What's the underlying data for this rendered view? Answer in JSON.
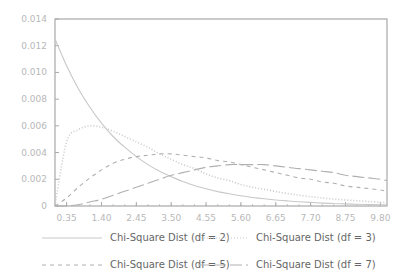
{
  "chart_data": {
    "type": "line",
    "title": "",
    "xlabel": "",
    "ylabel": "",
    "xlim": [
      0,
      10
    ],
    "ylim": [
      0,
      0.014
    ],
    "grid": false,
    "legend_position": "bottom",
    "x_ticks": [
      "0.35",
      "1.40",
      "2.45",
      "3.50",
      "4.55",
      "5.60",
      "6.65",
      "7.70",
      "8.75",
      "9.80"
    ],
    "y_ticks": [
      "0",
      "0.002",
      "0.004",
      "0.006",
      "0.008",
      "0.010",
      "0.012",
      "0.014"
    ],
    "x": [
      0.0,
      0.35,
      0.7,
      1.05,
      1.4,
      1.75,
      2.1,
      2.45,
      2.8,
      3.15,
      3.5,
      3.85,
      4.2,
      4.55,
      4.9,
      5.25,
      5.6,
      5.95,
      6.3,
      6.65,
      7.0,
      7.35,
      7.7,
      8.05,
      8.4,
      8.75,
      9.1,
      9.45,
      9.8,
      10.0
    ],
    "series": [
      {
        "name": "Chi-Square Dist (df = 2)",
        "style": "solid",
        "color": "#c8c8c8",
        "values": [
          0.0125,
          0.0105,
          0.0088,
          0.0074,
          0.0062,
          0.0052,
          0.0044,
          0.0037,
          0.0031,
          0.0026,
          0.0022,
          0.00183,
          0.00153,
          0.00129,
          0.00108,
          0.00091,
          0.00076,
          0.00064,
          0.00054,
          0.00045,
          0.00038,
          0.00032,
          0.00027,
          0.00022,
          0.00019,
          0.00016,
          0.00013,
          0.00011,
          9e-05,
          8e-05
        ]
      },
      {
        "name": "Chi-Square Dist (df = 3)",
        "style": "dotted",
        "color": "#c8c8c8",
        "values": [
          0.0,
          0.0048,
          0.0057,
          0.006,
          0.0059,
          0.0056,
          0.0052,
          0.0048,
          0.0044,
          0.0039,
          0.0035,
          0.0031,
          0.0028,
          0.0024,
          0.0021,
          0.0019,
          0.0016,
          0.0014,
          0.00125,
          0.00108,
          0.00094,
          0.00081,
          0.0007,
          0.0006,
          0.00052,
          0.00045,
          0.00039,
          0.00033,
          0.00028,
          0.00026
        ]
      },
      {
        "name": "Chi-Square Dist (df = 5)",
        "style": "dashed",
        "color": "#b0b0b0",
        "values": [
          0.0,
          0.0006,
          0.0014,
          0.0021,
          0.0027,
          0.0032,
          0.0035,
          0.0037,
          0.0038,
          0.0039,
          0.0039,
          0.0038,
          0.0037,
          0.0036,
          0.0034,
          0.0033,
          0.0031,
          0.0029,
          0.0027,
          0.0025,
          0.0023,
          0.0021,
          0.002,
          0.0018,
          0.0017,
          0.0015,
          0.0014,
          0.0013,
          0.0012,
          0.0011
        ]
      },
      {
        "name": "Chi-Square Dist (df = 7)",
        "style": "long-dashed",
        "color": "#b0b0b0",
        "values": [
          0.0,
          0.0,
          0.0001,
          0.0003,
          0.0005,
          0.0008,
          0.0011,
          0.0014,
          0.0017,
          0.002,
          0.0023,
          0.0025,
          0.0027,
          0.0029,
          0.003,
          0.0031,
          0.0031,
          0.0031,
          0.0031,
          0.003,
          0.0029,
          0.0028,
          0.0027,
          0.0026,
          0.0025,
          0.0023,
          0.0022,
          0.0021,
          0.002,
          0.0019
        ]
      }
    ]
  },
  "legend": {
    "items": [
      {
        "label": "Chi-Square Dist (df = 2)"
      },
      {
        "label": "Chi-Square Dist (df = 3)"
      },
      {
        "label": "Chi-Square Dist (df = 5)"
      },
      {
        "label": "Chi-Square Dist (df = 7)"
      }
    ]
  },
  "colors": {
    "axis": "#a8a8a8",
    "tick_label": "#b8b8b8",
    "legend_text": "#666666"
  }
}
